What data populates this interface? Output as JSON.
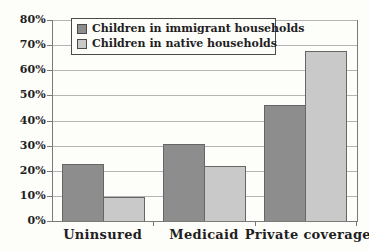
{
  "colors": {
    "background": "#fdfdfa",
    "text": "#1f1f1f",
    "axis": "#7a7a7a",
    "gridline": "#b5b5b5",
    "bar_border": "#666666",
    "legend_border": "#4a4a4a",
    "series_immigrant": "#8d8d8d",
    "series_native": "#c9c9c9"
  },
  "chart_data": {
    "type": "bar",
    "title": "",
    "xlabel": "",
    "ylabel": "",
    "categories": [
      "Uninsured",
      "Medicaid",
      "Private coverage"
    ],
    "series": [
      {
        "name": "Children in immigrant households",
        "color": "#8d8d8d",
        "values": [
          22.5,
          30.5,
          46
        ]
      },
      {
        "name": "Children in native households",
        "color": "#c9c9c9",
        "values": [
          9.5,
          22,
          67.5
        ]
      }
    ],
    "ylim": [
      0,
      80
    ],
    "ytick_step": 10,
    "ytick_labels": [
      "0%",
      "10%",
      "20%",
      "30%",
      "40%",
      "50%",
      "60%",
      "70%",
      "80%"
    ],
    "grid": true,
    "legend_position": "top-inside"
  }
}
